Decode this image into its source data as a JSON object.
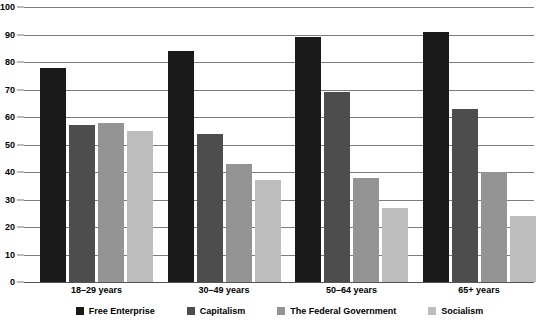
{
  "chart_data": {
    "type": "bar",
    "title": "",
    "subtitle": "",
    "xlabel": "",
    "ylabel": "",
    "ylim": [
      0,
      100
    ],
    "ytick_step": 10,
    "yticks": [
      0,
      10,
      20,
      30,
      40,
      50,
      60,
      70,
      80,
      90,
      100
    ],
    "grid": true,
    "legend_position": "bottom",
    "categories": [
      "18–29 years",
      "30–49 years",
      "50–64 years",
      "65+ years"
    ],
    "series": [
      {
        "name": "Free Enterprise",
        "color": "#1a1a1a",
        "values": [
          78,
          84,
          89,
          91
        ]
      },
      {
        "name": "Capitalism",
        "color": "#4d4d4d",
        "values": [
          57,
          54,
          69,
          63
        ]
      },
      {
        "name": "The Federal Government",
        "color": "#949494",
        "values": [
          58,
          43,
          38,
          40
        ]
      },
      {
        "name": "Socialism",
        "color": "#bdbdbd",
        "values": [
          55,
          37,
          27,
          24
        ]
      }
    ]
  },
  "axis": {
    "y_tick_labels": [
      "100",
      "90",
      "80",
      "70",
      "60",
      "50",
      "40",
      "30",
      "20",
      "10",
      "0"
    ]
  },
  "legend": {
    "items": [
      {
        "label": "Free Enterprise",
        "color": "#1a1a1a"
      },
      {
        "label": "Capitalism",
        "color": "#4d4d4d"
      },
      {
        "label": "The Federal Government",
        "color": "#949494"
      },
      {
        "label": "Socialism",
        "color": "#bdbdbd"
      }
    ]
  },
  "colors": {
    "background": "#ffffff",
    "gridline": "#7d7d7d",
    "axis_text": "#000000"
  }
}
